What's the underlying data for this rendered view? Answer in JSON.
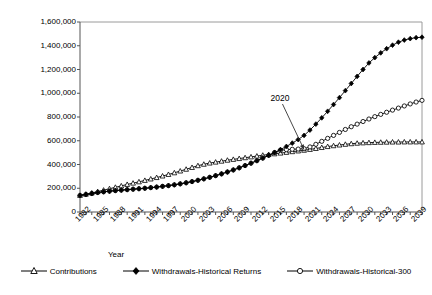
{
  "chart_data": {
    "type": "line",
    "title": "",
    "xlabel": "Year",
    "ylabel": "Millions of Year 2000 Dollars",
    "ylim": [
      0,
      1600000
    ],
    "xlim": [
      1982,
      2040
    ],
    "ytick_labels": [
      "1,600,000",
      "1,400,000",
      "1,200,000",
      "1,000,000",
      "800,000",
      "600,000",
      "400,000",
      "200,000",
      "0"
    ],
    "ytick_values": [
      1600000,
      1400000,
      1200000,
      1000000,
      800000,
      600000,
      400000,
      200000,
      0
    ],
    "xtick_labels": [
      "1982",
      "1985",
      "1988",
      "1991",
      "1994",
      "1997",
      "2000",
      "2003",
      "2006",
      "2009",
      "2012",
      "2015",
      "2018",
      "2021",
      "2024",
      "2027",
      "2030",
      "2033",
      "2036",
      "2039"
    ],
    "xtick_values": [
      1982,
      1985,
      1988,
      1991,
      1994,
      1997,
      2000,
      2003,
      2006,
      2009,
      2012,
      2015,
      2018,
      2021,
      2024,
      2027,
      2030,
      2033,
      2036,
      2039
    ],
    "grid": false,
    "legend_position": "bottom",
    "annotations": [
      {
        "text": "2020",
        "x": 2020,
        "y": 525000,
        "label_x": 2016,
        "label_y": 960000
      }
    ],
    "x": [
      1982,
      1983,
      1984,
      1985,
      1986,
      1987,
      1988,
      1989,
      1990,
      1991,
      1992,
      1993,
      1994,
      1995,
      1996,
      1997,
      1998,
      1999,
      2000,
      2001,
      2002,
      2003,
      2004,
      2005,
      2006,
      2007,
      2008,
      2009,
      2010,
      2011,
      2012,
      2013,
      2014,
      2015,
      2016,
      2017,
      2018,
      2019,
      2020,
      2021,
      2022,
      2023,
      2024,
      2025,
      2026,
      2027,
      2028,
      2029,
      2030,
      2031,
      2032,
      2033,
      2034,
      2035,
      2036,
      2037,
      2038,
      2039,
      2040
    ],
    "series": [
      {
        "name": "Contributions",
        "marker": "open-triangle",
        "values": [
          140000,
          150000,
          160000,
          172000,
          184000,
          196000,
          208000,
          220000,
          232000,
          243000,
          254000,
          266000,
          278000,
          290000,
          303000,
          316000,
          330000,
          345000,
          360000,
          375000,
          390000,
          402000,
          412000,
          420000,
          428000,
          436000,
          443000,
          450000,
          457000,
          464000,
          471000,
          478000,
          484000,
          490000,
          496000,
          502000,
          508000,
          514000,
          520000,
          527000,
          535000,
          543000,
          551000,
          558000,
          564000,
          570000,
          575000,
          579000,
          582000,
          584000,
          586000,
          587000,
          588000,
          589000,
          589000,
          590000,
          590000,
          590000,
          590000
        ]
      },
      {
        "name": "Withdrawals-Historical Returns",
        "marker": "filled-diamond",
        "values": [
          140000,
          148000,
          156000,
          164000,
          170000,
          175000,
          180000,
          184000,
          188000,
          192000,
          196000,
          200000,
          205000,
          210000,
          216000,
          222000,
          229000,
          237000,
          246000,
          256000,
          267000,
          279000,
          292000,
          306000,
          321000,
          337000,
          354000,
          372000,
          391000,
          411000,
          432000,
          454000,
          477000,
          501000,
          526000,
          552000,
          580000,
          610000,
          645000,
          690000,
          740000,
          793000,
          848000,
          905000,
          963000,
          1022000,
          1082000,
          1142000,
          1200000,
          1255000,
          1300000,
          1340000,
          1375000,
          1405000,
          1430000,
          1448000,
          1460000,
          1468000,
          1472000
        ]
      },
      {
        "name": "Withdrawals-Historical-300",
        "marker": "open-circle",
        "values": [
          140000,
          148000,
          156000,
          164000,
          170000,
          175000,
          180000,
          184000,
          188000,
          192000,
          196000,
          200000,
          205000,
          210000,
          216000,
          222000,
          229000,
          237000,
          246000,
          256000,
          267000,
          279000,
          292000,
          306000,
          321000,
          337000,
          354000,
          372000,
          391000,
          411000,
          432000,
          454000,
          477000,
          501000,
          520000,
          525000,
          528000,
          530000,
          533000,
          548000,
          570000,
          595000,
          620000,
          645000,
          670000,
          695000,
          718000,
          740000,
          762000,
          783000,
          803000,
          822000,
          840000,
          858000,
          875000,
          893000,
          910000,
          926000,
          940000
        ]
      }
    ]
  },
  "legend": {
    "items": [
      {
        "label": "Contributions",
        "key": "open-triangle-key"
      },
      {
        "label": "Withdrawals-Historical Returns",
        "key": "filled-diamond-key"
      },
      {
        "label": "Withdrawals-Historical-300",
        "key": "open-circle-key"
      }
    ]
  }
}
